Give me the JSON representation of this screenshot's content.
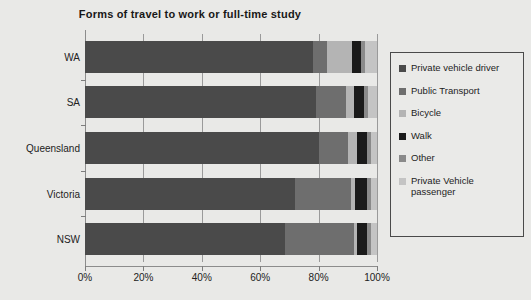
{
  "chart_data": {
    "type": "bar",
    "orientation": "horizontal",
    "stacked": true,
    "title": "Forms of travel to work or full-time study",
    "xlabel": "",
    "ylabel": "",
    "xlim": [
      0,
      100
    ],
    "xtick_labels": [
      "0%",
      "20%",
      "40%",
      "60%",
      "80%",
      "100%"
    ],
    "xticks": [
      0,
      20,
      40,
      60,
      80,
      100
    ],
    "grid": true,
    "legend_position": "right",
    "categories": [
      "WA",
      "SA",
      "Queensland",
      "Victoria",
      "NSW"
    ],
    "series": [
      {
        "name": "Private vehicle driver",
        "color": "#4a4a4a",
        "values": [
          78,
          79,
          80,
          72,
          68.5
        ]
      },
      {
        "name": "Public Transport",
        "color": "#6e6e6e",
        "values": [
          5,
          10.5,
          10,
          19,
          23.5
        ]
      },
      {
        "name": "Bicycle",
        "color": "#b4b4b4",
        "values": [
          8.5,
          2.5,
          3,
          1.5,
          1
        ]
      },
      {
        "name": "Walk",
        "color": "#1a1a1a",
        "values": [
          3,
          3.5,
          3.5,
          4,
          3.5
        ]
      },
      {
        "name": "Other",
        "color": "#8a8a8a",
        "values": [
          1.5,
          1.5,
          1.5,
          1.5,
          1.5
        ]
      },
      {
        "name": "Private Vehicle passenger",
        "color": "#c4c4c4",
        "values": [
          4,
          3,
          2,
          2,
          2
        ]
      }
    ]
  },
  "legend": {
    "items": [
      {
        "label": "Private vehicle driver"
      },
      {
        "label": "Public Transport"
      },
      {
        "label": "Bicycle"
      },
      {
        "label": "Walk"
      },
      {
        "label": "Other"
      },
      {
        "label": "Private Vehicle passenger"
      }
    ]
  }
}
